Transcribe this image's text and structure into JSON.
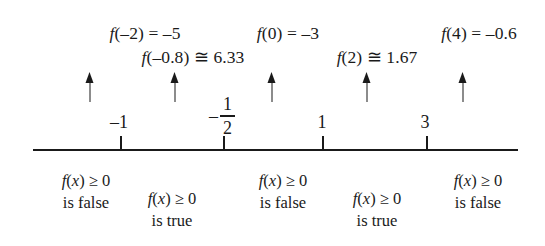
{
  "figure": {
    "background_color": "#ffffff",
    "ink_color": "#1a1a1a"
  },
  "evaluations": [
    {
      "id": "eval-neg2",
      "text": "f(–2) = –5",
      "x": 145,
      "y": 24,
      "align": "center"
    },
    {
      "id": "eval-neg08",
      "text": "f(–0.8) ≅ 6.33",
      "x": 193,
      "y": 48,
      "align": "center"
    },
    {
      "id": "eval-zero",
      "text": "f(0) = –3",
      "x": 288,
      "y": 24,
      "align": "center"
    },
    {
      "id": "eval-two",
      "text": "f(2) ≅ 1.67",
      "x": 377,
      "y": 48,
      "align": "center"
    },
    {
      "id": "eval-four",
      "text": "f(4) = –0.6",
      "x": 479,
      "y": 24,
      "align": "center"
    }
  ],
  "arrows": [
    {
      "id": "arrow-neg2",
      "x": 90,
      "y": 72
    },
    {
      "id": "arrow-neg08",
      "x": 175,
      "y": 72
    },
    {
      "id": "arrow-zero",
      "x": 272,
      "y": 72
    },
    {
      "id": "arrow-two",
      "x": 367,
      "y": 72
    },
    {
      "id": "arrow-four",
      "x": 463,
      "y": 72
    }
  ],
  "number_line": {
    "x_start": 33,
    "x_end": 518,
    "y": 149,
    "tick_height": 14,
    "ticks": [
      {
        "id": "tick-neg1",
        "value": "–1",
        "x": 121,
        "label_x": 119,
        "label_y": 113,
        "label_type": "plain"
      },
      {
        "id": "tick-neg-half",
        "value": "-1/2",
        "x": 224,
        "label_x": 222,
        "label_y": 95,
        "label_type": "fraction",
        "fraction": {
          "sign": "–",
          "numerator": "1",
          "denominator": "2"
        }
      },
      {
        "id": "tick-one",
        "value": "1",
        "x": 323,
        "label_x": 322,
        "label_y": 113,
        "label_type": "plain"
      },
      {
        "id": "tick-three",
        "value": "3",
        "x": 427,
        "label_x": 425,
        "label_y": 113,
        "label_type": "plain"
      }
    ]
  },
  "statements": [
    {
      "id": "statement-interval-1",
      "line1": "f(x) ≥ 0",
      "line2": "is false",
      "x": 86,
      "y": 170
    },
    {
      "id": "statement-interval-2",
      "line1": "f(x) ≥ 0",
      "line2": "is true",
      "x": 172,
      "y": 188
    },
    {
      "id": "statement-interval-3",
      "line1": "f(x) ≥ 0",
      "line2": "is false",
      "x": 283,
      "y": 170
    },
    {
      "id": "statement-interval-4",
      "line1": "f(x) ≥ 0",
      "line2": "is true",
      "x": 377,
      "y": 188
    },
    {
      "id": "statement-interval-5",
      "line1": "f(x) ≥ 0",
      "line2": "is false",
      "x": 478,
      "y": 170
    }
  ]
}
